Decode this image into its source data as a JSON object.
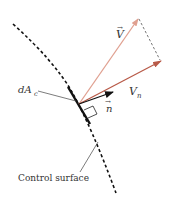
{
  "diagram": {
    "labels": {
      "velocity": "V",
      "velocity_arrow": "→",
      "normal_velocity": "V",
      "normal_velocity_sub": "n",
      "normal_vector": "n",
      "normal_vector_arrow": "→",
      "area_element": "dA",
      "area_element_sub": "c",
      "control_surface": "Control surface"
    },
    "colors": {
      "velocity": "#e0a090",
      "normal_velocity": "#b85a48",
      "normal_vector": "#111111",
      "surface": "#111111",
      "leader": "#444444"
    },
    "elements": [
      {
        "id": "control-surface",
        "type": "dashed-curve"
      },
      {
        "id": "area-element",
        "type": "solid-segment"
      },
      {
        "id": "velocity-vector",
        "type": "arrow"
      },
      {
        "id": "normal-velocity-vector",
        "type": "arrow"
      },
      {
        "id": "normal-unit-vector",
        "type": "arrow"
      },
      {
        "id": "projection-line",
        "type": "dashed-line"
      },
      {
        "id": "right-angle-marker",
        "type": "marker"
      }
    ]
  }
}
